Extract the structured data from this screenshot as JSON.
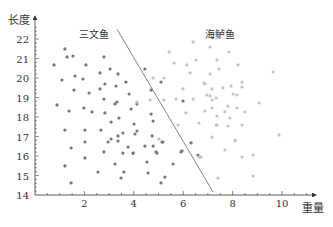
{
  "chart_data": {
    "type": "scatter",
    "title": "",
    "xlabel": "重量",
    "ylabel": "长度",
    "xlim": [
      0,
      11.5
    ],
    "ylim": [
      14,
      22.8
    ],
    "x_ticks": [
      2,
      4,
      6,
      8,
      10
    ],
    "y_ticks": [
      14,
      15,
      16,
      17,
      18,
      19,
      20,
      21,
      22
    ],
    "grid": false,
    "legend": "none",
    "annotations": [
      {
        "text": "三文鱼",
        "x": 3.0,
        "y": 22.2
      },
      {
        "text": "海鲈鱼",
        "x": 8.1,
        "y": 22.2
      }
    ],
    "decision_boundary": {
      "x1": 3.32,
      "y1": 22.5,
      "x2": 7.21,
      "y2": 14.15
    },
    "series": [
      {
        "name": "三文鱼",
        "color": "#777777",
        "points": [
          [
            1.21,
            21.49
          ],
          [
            1.3,
            21.08
          ],
          [
            1.54,
            21.13
          ],
          [
            0.77,
            20.67
          ],
          [
            2.79,
            21.08
          ],
          [
            2.06,
            20.67
          ],
          [
            2.63,
            20.26
          ],
          [
            3.04,
            20.46
          ],
          [
            3.36,
            20.21
          ],
          [
            1.09,
            19.9
          ],
          [
            1.62,
            20.1
          ],
          [
            1.94,
            19.95
          ],
          [
            2.83,
            19.69
          ],
          [
            3.68,
            19.79
          ],
          [
            1.58,
            19.38
          ],
          [
            2.19,
            19.23
          ],
          [
            2.63,
            19.44
          ],
          [
            3.28,
            19.59
          ],
          [
            3.81,
            19.18
          ],
          [
            2.79,
            18.92
          ],
          [
            3.32,
            18.77
          ],
          [
            3.24,
            18.67
          ],
          [
            4.13,
            18.67
          ],
          [
            0.89,
            18.62
          ],
          [
            1.98,
            18.46
          ],
          [
            3.89,
            18.41
          ],
          [
            1.38,
            18.31
          ],
          [
            2.31,
            18.26
          ],
          [
            2.83,
            18.21
          ],
          [
            3.4,
            17.95
          ],
          [
            3.08,
            17.74
          ],
          [
            1.21,
            17.33
          ],
          [
            2.02,
            17.33
          ],
          [
            2.67,
            17.33
          ],
          [
            3.56,
            17.18
          ],
          [
            3.36,
            17.03
          ],
          [
            3.08,
            16.87
          ],
          [
            2.96,
            16.72
          ],
          [
            3.36,
            16.77
          ],
          [
            4.01,
            17.64
          ],
          [
            4.13,
            17.28
          ],
          [
            4.05,
            17.13
          ],
          [
            2.02,
            16.72
          ],
          [
            1.46,
            16.41
          ],
          [
            3.77,
            16.46
          ],
          [
            2.79,
            16.21
          ],
          [
            3.56,
            16.15
          ],
          [
            3.97,
            16.15
          ],
          [
            2.02,
            15.9
          ],
          [
            1.21,
            15.49
          ],
          [
            3.24,
            15.59
          ],
          [
            2.55,
            15.18
          ],
          [
            3.6,
            15.18
          ],
          [
            3.48,
            14.87
          ],
          [
            1.46,
            14.62
          ],
          [
            4.45,
            20.46
          ],
          [
            5.1,
            19.79
          ],
          [
            4.7,
            19.38
          ],
          [
            5.99,
            18.82
          ],
          [
            4.7,
            18.15
          ],
          [
            4.78,
            17.79
          ],
          [
            4.74,
            17.03
          ],
          [
            5.18,
            16.72
          ],
          [
            4.45,
            16.51
          ],
          [
            4.78,
            16.51
          ],
          [
            4.9,
            16.21
          ],
          [
            6.32,
            16.67
          ],
          [
            5.95,
            16.26
          ],
          [
            6.6,
            16.05
          ],
          [
            5.14,
            16.72
          ],
          [
            4.94,
            16.15
          ],
          [
            5.91,
            16.21
          ],
          [
            4.53,
            15.69
          ],
          [
            5.59,
            15.59
          ],
          [
            4.58,
            15.13
          ],
          [
            5.26,
            14.92
          ],
          [
            5.1,
            14.62
          ],
          [
            3.97,
            16.15
          ]
        ]
      },
      {
        "name": "海鲈鱼",
        "color": "#c4c4c4",
        "points": [
          [
            6.4,
            21.85
          ],
          [
            5.43,
            21.33
          ],
          [
            5.63,
            20.77
          ],
          [
            6.15,
            20.67
          ],
          [
            6.52,
            20.92
          ],
          [
            6.28,
            20.26
          ],
          [
            4.78,
            20.0
          ],
          [
            5.22,
            20.0
          ],
          [
            5.99,
            19.44
          ],
          [
            6.88,
            19.69
          ],
          [
            7.09,
            19.08
          ],
          [
            4.13,
            18.77
          ],
          [
            4.66,
            18.87
          ],
          [
            5.22,
            18.87
          ],
          [
            5.71,
            18.92
          ],
          [
            6.4,
            18.92
          ],
          [
            7.09,
            21.59
          ],
          [
            7.85,
            21.33
          ],
          [
            7.37,
            20.92
          ],
          [
            8.22,
            20.67
          ],
          [
            7.45,
            20.46
          ],
          [
            9.64,
            20.31
          ],
          [
            7.09,
            20.21
          ],
          [
            6.84,
            19.74
          ],
          [
            8.38,
            19.79
          ],
          [
            7.17,
            19.44
          ],
          [
            7.61,
            19.49
          ],
          [
            7.94,
            19.59
          ],
          [
            8.38,
            19.54
          ],
          [
            6.96,
            19.13
          ],
          [
            8.02,
            19.18
          ],
          [
            8.18,
            19.13
          ],
          [
            7.33,
            18.97
          ],
          [
            7.17,
            18.87
          ],
          [
            9.07,
            18.72
          ],
          [
            7.81,
            18.56
          ],
          [
            7.17,
            18.46
          ],
          [
            8.18,
            18.46
          ],
          [
            6.88,
            18.31
          ],
          [
            7.69,
            18.26
          ],
          [
            8.5,
            18.26
          ],
          [
            7.37,
            18.05
          ],
          [
            7.89,
            17.95
          ],
          [
            7.33,
            17.59
          ],
          [
            7.81,
            17.54
          ],
          [
            8.38,
            17.59
          ],
          [
            7.17,
            16.97
          ],
          [
            8.1,
            16.82
          ],
          [
            9.88,
            17.08
          ],
          [
            7.69,
            16.31
          ],
          [
            6.72,
            15.95
          ],
          [
            8.38,
            15.95
          ],
          [
            8.83,
            16.05
          ],
          [
            8.83,
            14.97
          ],
          [
            7.41,
            14.87
          ],
          [
            6.11,
            18.21
          ],
          [
            5.79,
            17.59
          ],
          [
            6.64,
            17.69
          ],
          [
            7.37,
            17.59
          ],
          [
            5.02,
            16.87
          ],
          [
            6.64,
            15.95
          ],
          [
            6.68,
            15.95
          ],
          [
            8.1,
            16.77
          ]
        ]
      }
    ]
  }
}
